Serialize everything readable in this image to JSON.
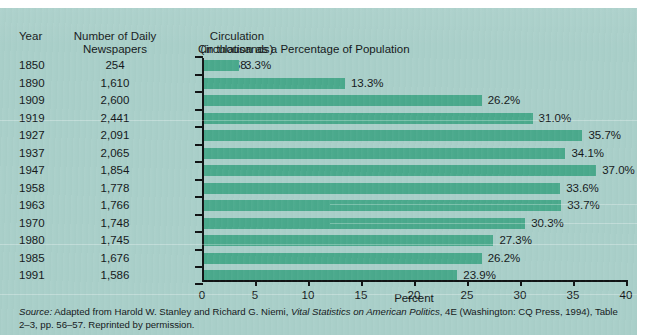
{
  "figure": {
    "chart_title": "Circulation as a Percentage of Population",
    "xaxis_title": "Percent",
    "source_lead": "Source:",
    "source_text_1": " Adapted from Harold W. Stanley and Richard G. Niemi, ",
    "source_italic": "Vital Statistics on American Politics",
    "source_text_2": ", 4E  (Washington: CQ Press, 1994), Table 2–3, pp. 56–57. Reprinted by permission."
  },
  "table": {
    "headers": {
      "year": "Year",
      "newspapers_line1": "Number of Daily",
      "newspapers_line2": "Newspapers",
      "circulation_line1": "Circulation",
      "circulation_line2": "(in thousands)"
    },
    "rows": [
      {
        "year": "1850",
        "newspapers": "254",
        "circulation": "758"
      },
      {
        "year": "1890",
        "newspapers": "1,610",
        "circulation": "8,387"
      },
      {
        "year": "1909",
        "newspapers": "2,600",
        "circulation": "24,212"
      },
      {
        "year": "1919",
        "newspapers": "2,441",
        "circulation": "33,029"
      },
      {
        "year": "1927",
        "newspapers": "2,091",
        "circulation": "41,368"
      },
      {
        "year": "1937",
        "newspapers": "2,065",
        "circulation": "43,345"
      },
      {
        "year": "1947",
        "newspapers": "1,854",
        "circulation": "53,287"
      },
      {
        "year": "1958",
        "newspapers": "1,778",
        "circulation": "58,713"
      },
      {
        "year": "1963",
        "newspapers": "1,766",
        "circulation": "63,831"
      },
      {
        "year": "1970",
        "newspapers": "1,748",
        "circulation": "62,100"
      },
      {
        "year": "1980",
        "newspapers": "1,745",
        "circulation": "62,200"
      },
      {
        "year": "1985",
        "newspapers": "1,676",
        "circulation": "62,800"
      },
      {
        "year": "1991",
        "newspapers": "1,586",
        "circulation": "60,687"
      }
    ]
  },
  "colors": {
    "background": "#a9cfc9",
    "bar": "#4aa98c",
    "axis": "#101314",
    "text": "#14181a"
  },
  "chart_data": {
    "type": "bar",
    "orientation": "horizontal",
    "title": "Circulation as a Percentage of Population",
    "xlabel": "Percent",
    "ylabel": "",
    "xlim": [
      0,
      40
    ],
    "xticks": [
      0,
      5,
      10,
      15,
      20,
      25,
      30,
      35,
      40
    ],
    "grid": false,
    "legend": "none",
    "categories": [
      "1850",
      "1890",
      "1909",
      "1919",
      "1927",
      "1937",
      "1947",
      "1958",
      "1963",
      "1970",
      "1980",
      "1985",
      "1991"
    ],
    "values": [
      3.3,
      13.3,
      26.2,
      31.0,
      35.7,
      34.1,
      37.0,
      33.6,
      33.7,
      30.3,
      27.3,
      26.2,
      23.9
    ],
    "data_labels": [
      "3.3%",
      "13.3%",
      "26.2%",
      "31.0%",
      "35.7%",
      "34.1%",
      "37.0%",
      "33.6%",
      "33.7%",
      "30.3%",
      "27.3%",
      "26.2%",
      "23.9%"
    ]
  }
}
